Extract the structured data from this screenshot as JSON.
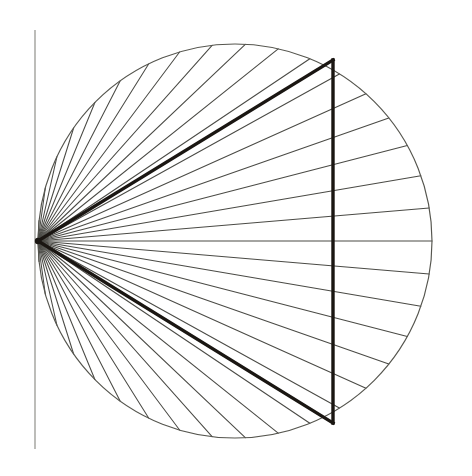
{
  "figure": {
    "background_color": "#ffffff",
    "canvas": {
      "width": 472,
      "height": 476
    }
  },
  "geometry": {
    "circle": {
      "center_x": 235,
      "center_y": 241,
      "radius": 197,
      "stroke_color": "#55554e",
      "stroke_width": 1.15,
      "fill": "none",
      "label": "circumference"
    },
    "apex": {
      "x": 38,
      "y": 241,
      "label": "apex-vertex",
      "dot_radius": 3.2,
      "dot_color": "#1a1612"
    },
    "tangent_axis": {
      "x": 35,
      "y_top": 30,
      "y_bottom": 449,
      "stroke_color": "#8c8c86",
      "stroke_width": 1.15,
      "label": "vertical tangent axis"
    },
    "chord": {
      "x": 333,
      "y_top": 60,
      "y_bottom": 423,
      "stroke_color": "#1a1612",
      "stroke_width": 3.4,
      "label": "bold vertical chord"
    },
    "heavy_triangle": {
      "vertices": [
        {
          "x": 38,
          "y": 241,
          "name": "apex"
        },
        {
          "x": 333,
          "y": 60,
          "name": "top-vertex"
        },
        {
          "x": 333,
          "y": 423,
          "name": "bottom-vertex"
        }
      ],
      "stroke_color": "#1a1612",
      "stroke_width": 3.4
    },
    "rays": {
      "count": 37,
      "origin": "apex",
      "stroke_color": "#4a4a45",
      "stroke_width": 1.05,
      "angle_start_deg": -174,
      "angle_end_deg": 174,
      "angle_step_deg": 9.6666667,
      "note": "Each ray runs from the apex on the circle to an equally spaced point on the circumference; inscribed-angle spacing halves the central-angle spacing.",
      "endpoint_angles_deg": [
        -174,
        -164.33,
        -154.67,
        -145,
        -135.33,
        -125.67,
        -116,
        -106.33,
        -96.67,
        -87,
        -77.33,
        -67.67,
        -58,
        -48.33,
        -38.67,
        -29,
        -19.33,
        -9.67,
        0,
        9.67,
        19.33,
        29,
        38.67,
        48.33,
        58,
        67.67,
        77.33,
        87,
        96.67,
        106.33,
        116,
        125.67,
        135.33,
        145,
        154.67,
        164.33,
        174
      ]
    }
  },
  "style_tokens": {
    "ray_color": "#4a4a45",
    "circle_color": "#55554e",
    "axis_color": "#8c8c86",
    "heavy_color": "#1a1612",
    "background": "#ffffff"
  }
}
